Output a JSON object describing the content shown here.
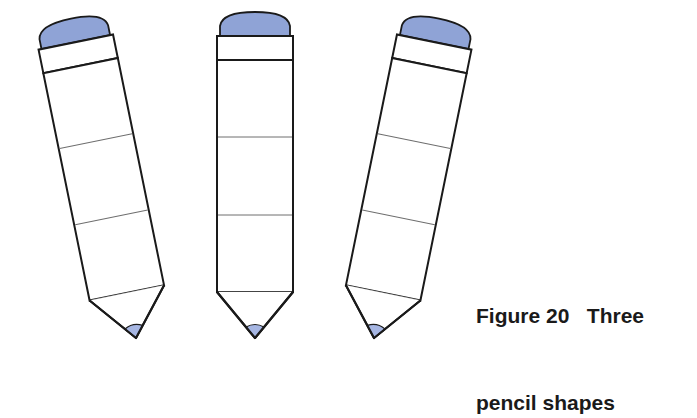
{
  "figure": {
    "caption_line1": "Figure 20   Three",
    "caption_line2": "pencil shapes",
    "colors": {
      "eraser": "#8fa3d6",
      "tip": "#a6b6e3",
      "outline": "#1a1a1a",
      "segment_line": "#6e6e6e",
      "body": "#ffffff"
    },
    "pencils": [
      {
        "name": "left",
        "orientation": "tilted-clockwise",
        "rotation_deg": 11.5
      },
      {
        "name": "middle",
        "orientation": "upright",
        "rotation_deg": 0
      },
      {
        "name": "right",
        "orientation": "tilted-counterclockwise",
        "rotation_deg": -11.5
      }
    ]
  }
}
